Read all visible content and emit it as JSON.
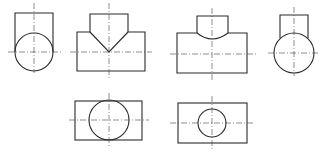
{
  "diagram": {
    "type": "orthographic-projection-exercise",
    "colors": {
      "line": "#2a2a2a",
      "centerline": "#444444",
      "background": "#ffffff"
    },
    "views": [
      {
        "id": "view-1",
        "description": "Side view: rectangle stub atop circle (cylinder end)"
      },
      {
        "id": "view-2",
        "description": "Front view: T-intersection with V-shaped (straight line) intersection curve"
      },
      {
        "id": "view-3",
        "description": "Front view: T-intersection with curved intersection line"
      },
      {
        "id": "view-4",
        "description": "Side view: narrower rectangle stub atop circle"
      },
      {
        "id": "view-5",
        "description": "Top view: rectangle with large circle (equal diameters)"
      },
      {
        "id": "view-6",
        "description": "Top view: rectangle with small circle (smaller branch diameter)"
      }
    ]
  }
}
